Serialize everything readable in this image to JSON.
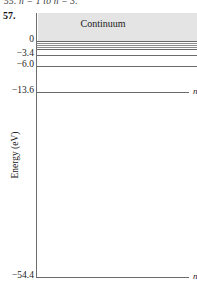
{
  "page": {
    "previous_problem_fragment": "55. n = 1 to n = 3.",
    "problem_number": "57."
  },
  "figure": {
    "continuum_label": "Continuum",
    "y_axis_title": "Energy (eV)",
    "axis": {
      "tick_labels": [
        "0",
        "−3.4",
        "−6.0",
        "−13.6",
        "−54.4"
      ]
    },
    "levels": [
      {
        "name": "n-infinity",
        "label_n": "n",
        "label_eq": "=",
        "label_val": "∞",
        "energy": "0",
        "y": 41,
        "length": 160,
        "weight": "strong"
      },
      {
        "name": "n-8",
        "label_n": "",
        "label_eq": "",
        "label_val": "",
        "energy": "-0.85",
        "y": 43,
        "length": 160,
        "weight": "normal"
      },
      {
        "name": "n-7",
        "label_n": "",
        "label_eq": "",
        "label_val": "",
        "energy": "-1.11",
        "y": 45,
        "length": 160,
        "weight": "normal"
      },
      {
        "name": "n-6",
        "label_n": "",
        "label_eq": "",
        "label_val": "",
        "energy": "-1.51",
        "y": 47,
        "length": 160,
        "weight": "normal"
      },
      {
        "name": "n-5",
        "label_n": "n",
        "label_eq": "=",
        "label_val": "5",
        "energy": "-2.2",
        "y": 49,
        "length": 160,
        "weight": "strong"
      },
      {
        "name": "n-4",
        "label_n": "n",
        "label_eq": "=",
        "label_val": "4",
        "energy": "-3.4",
        "y": 55,
        "length": 160,
        "weight": "strong"
      },
      {
        "name": "n-3",
        "label_n": "n",
        "label_eq": "=",
        "label_val": "3",
        "energy": "-6.0",
        "y": 66,
        "length": 160,
        "weight": "strong"
      },
      {
        "name": "n-2",
        "label_n": "n",
        "label_eq": "=",
        "label_val": "2",
        "energy": "-13.6",
        "y": 92,
        "length": 152,
        "weight": "strong"
      },
      {
        "name": "n-1",
        "label_n": "n",
        "label_eq": "=",
        "label_val": "1",
        "energy": "-54.4",
        "y": 277,
        "length": 152,
        "weight": "strong"
      }
    ],
    "ticks": [
      {
        "name": "tick-0",
        "label": "0",
        "y": 41
      },
      {
        "name": "tick-3.4",
        "label": "−3.4",
        "y": 55
      },
      {
        "name": "tick-6.0",
        "label": "−6.0",
        "y": 66
      },
      {
        "name": "tick-13.6",
        "label": "−13.6",
        "y": 92
      },
      {
        "name": "tick-54.4",
        "label": "−54.4",
        "y": 277
      }
    ],
    "colors": {
      "axis": "#6e6e6e",
      "level_line": "#8a8a8a",
      "continuum_fill": "#e4e4e4",
      "text": "#1a1a1a",
      "background": "#ffffff"
    }
  },
  "chart_data": {
    "type": "line",
    "xlabel": "",
    "ylabel": "Energy (eV)",
    "categories": [
      "n = 1",
      "n = 2",
      "n = 3",
      "n = 4",
      "n = 5",
      "n = ∞"
    ],
    "values": [
      -54.4,
      -13.6,
      -6.0,
      -3.4,
      -2.2,
      0
    ],
    "ylim": [
      -54.4,
      0
    ],
    "tick_values": [
      0,
      -3.4,
      -6.0,
      -13.6,
      -54.4
    ],
    "annotations": [
      "Continuum"
    ],
    "grid": false,
    "legend": "none"
  }
}
